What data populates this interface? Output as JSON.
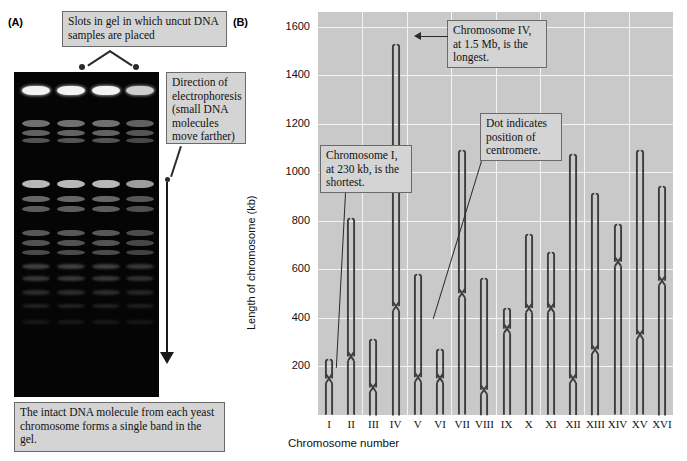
{
  "panels": {
    "a_letter": "(A)",
    "b_letter": "(B)"
  },
  "panel_a": {
    "callout_slots": "Slots in gel in which uncut DNA samples are placed",
    "callout_direction": "Direction of electrophoresis (small DNA molecules move farther)",
    "callout_caption": "The intact DNA molecule from each yeast chromosome forms a single band in the gel.",
    "gel": {
      "lane_count": 4,
      "description": "pulsed-field gel electrophoresis of yeast chromosomes"
    }
  },
  "panel_b": {
    "callout_shortest": "Chromosome I, at 230 kb, is the shortest.",
    "callout_longest": "Chromosome IV, at 1.5 Mb, is the longest.",
    "callout_centromere": "Dot indicates position of centromere."
  },
  "chart_data": {
    "type": "bar",
    "title": "",
    "xlabel": "Chromosome number",
    "ylabel": "Length of chromosome (kb)",
    "ylim": [
      0,
      1660
    ],
    "yticks": [
      200,
      400,
      600,
      800,
      1000,
      1200,
      1400,
      1600
    ],
    "grid": true,
    "legend": "none",
    "categories": [
      "I",
      "II",
      "III",
      "IV",
      "V",
      "VI",
      "VII",
      "VIII",
      "IX",
      "X",
      "XI",
      "XII",
      "XIII",
      "XIV",
      "XV",
      "XVI"
    ],
    "values": [
      230,
      810,
      315,
      1530,
      580,
      270,
      1090,
      565,
      440,
      745,
      670,
      1075,
      915,
      785,
      1090,
      945
    ],
    "centromere_kb": [
      150,
      240,
      115,
      450,
      155,
      150,
      500,
      105,
      355,
      440,
      440,
      150,
      270,
      630,
      330,
      555
    ],
    "series": [
      {
        "name": "Length of chromosome (kb)",
        "values": [
          230,
          810,
          315,
          1530,
          580,
          270,
          1090,
          565,
          440,
          745,
          670,
          1075,
          915,
          785,
          1090,
          945
        ]
      }
    ]
  },
  "colors": {
    "plot_background": "#c9c9c9",
    "gridline": "#f4f4f4",
    "chromosome": "#3d3d3d",
    "callout_fill": "#d4d4d4",
    "callout_border": "#6a6a6a",
    "gel_background": "#050505"
  }
}
